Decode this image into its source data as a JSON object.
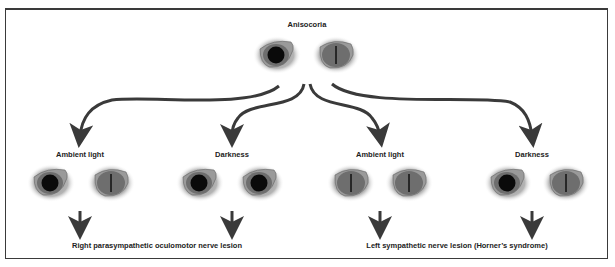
{
  "title": "Anisocoria",
  "panels": [
    {
      "label": "Ambient light",
      "left_eye": "dilated",
      "right_eye": "slit"
    },
    {
      "label": "Darkness",
      "left_eye": "dilated",
      "right_eye": "dilated"
    },
    {
      "label": "Ambient light",
      "left_eye": "slit",
      "right_eye": "slit"
    },
    {
      "label": "Darkness",
      "left_eye": "dilated",
      "right_eye": "slit"
    }
  ],
  "top_eyes": {
    "left_eye": "dilated",
    "right_eye": "slit"
  },
  "conclusions": [
    "Right parasympathetic oculomotor nerve lesion",
    "Left sympathetic nerve lesion (Horner’s syndrome)"
  ],
  "colors": {
    "iris": "#6e6e6e",
    "pupil": "#0a0a0a",
    "arrow": "#3a3a3a",
    "frame": "#3a3a3a"
  }
}
